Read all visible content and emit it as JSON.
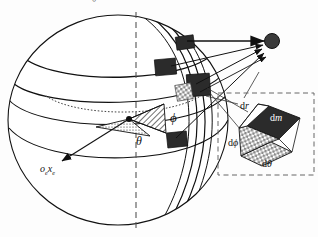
{
  "page": {
    "clipped_header_text": "一一一一一一一一。",
    "figure_title": "Spherical mass element geometry"
  },
  "colors": {
    "ink": "#111111",
    "mass_fill": "#2b2b2b",
    "dash": "#555555",
    "hatch": "#000000",
    "paper": "#fdfdfd",
    "label_on_dark": "#ffffff"
  },
  "labels": {
    "phi": "ϕ",
    "theta": "θ",
    "frame_axis": "o",
    "frame_axis_sub1": "e",
    "frame_axis_x": "x",
    "frame_axis_sub2": "e",
    "d_r": "d",
    "d_r_var": "r",
    "d_m": "d",
    "d_m_var": "m",
    "d_phi": "d",
    "d_phi_var": "ϕ",
    "d_theta": "d",
    "d_theta_var": "θ"
  },
  "diagram": {
    "type": "spherical-coordinate-mass-element",
    "sphere": {
      "cx": 118,
      "cy": 120,
      "rx": 110,
      "ry": 105,
      "center_point": {
        "x": 129,
        "y": 119
      }
    },
    "polar_axis": {
      "style": "dashed",
      "x": 136,
      "y_top": 14,
      "y_bottom": 228
    },
    "latitude_circles": 3,
    "meridian_band": "longitude strip from north pole to south pole",
    "wedges": [
      {
        "name": "theta-wedge",
        "fill": "dotted",
        "label": "θ"
      },
      {
        "name": "phi-wedge",
        "fill": "diagonal-hatch",
        "label": "ϕ"
      }
    ],
    "mass_elements": [
      {
        "name": "mass-element-1",
        "x": 176,
        "y": 38,
        "w": 17,
        "h": 13
      },
      {
        "name": "mass-element-2",
        "x": 157,
        "y": 60,
        "w": 20,
        "h": 15
      },
      {
        "name": "mass-element-3",
        "x": 188,
        "y": 75,
        "w": 22,
        "h": 22
      },
      {
        "name": "mass-element-4",
        "x": 168,
        "y": 133,
        "w": 19,
        "h": 14
      }
    ],
    "field_point": {
      "name": "point-mass",
      "x": 272,
      "y": 41,
      "r": 7
    },
    "arrow_count": 4,
    "inset": {
      "box": {
        "x": 218,
        "y": 93,
        "w": 96,
        "h": 82,
        "style": "dashed"
      },
      "element": "parallelepiped volume element dV = dr · r dϕ · r sinϕ dθ",
      "faces": [
        {
          "name": "dm-face",
          "fill": "solid-dark"
        },
        {
          "name": "dphi-face",
          "fill": "checker"
        },
        {
          "name": "dtheta-face",
          "fill": "checker"
        }
      ]
    }
  }
}
